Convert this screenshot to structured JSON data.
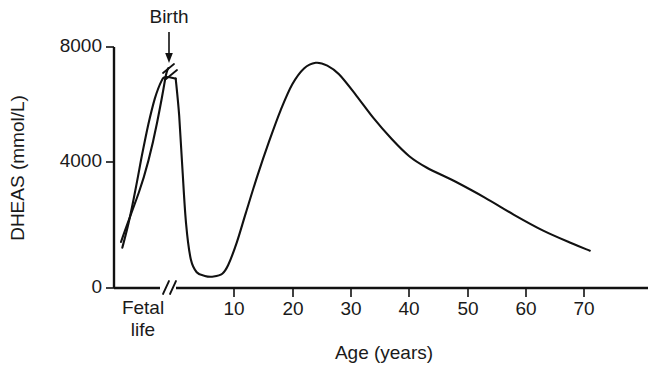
{
  "chart_data": {
    "type": "line",
    "title": "",
    "xlabel": "Age (years)",
    "ylabel": "DHEAS (mmol/L)",
    "xlim": [
      -12,
      74
    ],
    "ylim": [
      0,
      8400
    ],
    "grid": false,
    "legend": "none",
    "axis_break_x": "between fetal life and postnatal age scale",
    "curve_break_marker": "slash break on curve at birth peak",
    "x_ticks": [
      {
        "value": 10,
        "label": "10"
      },
      {
        "value": 20,
        "label": "20"
      },
      {
        "value": 30,
        "label": "30"
      },
      {
        "value": 40,
        "label": "40"
      },
      {
        "value": 50,
        "label": "50"
      },
      {
        "value": 60,
        "label": "60"
      },
      {
        "value": 70,
        "label": "70"
      }
    ],
    "y_ticks": [
      {
        "value": 0,
        "label": "0"
      },
      {
        "value": 4000,
        "label": "4000"
      },
      {
        "value": 8000,
        "label": "8000"
      }
    ],
    "category_labels": [
      {
        "line1": "Fetal",
        "line2": "life"
      }
    ],
    "annotations": [
      {
        "text": "Birth",
        "points_to": "peak of fetal DHEAS curve at birth"
      }
    ],
    "series": [
      {
        "name": "DHEAS concentration",
        "points": [
          {
            "x": -11.0,
            "y": 1400,
            "stage": "early fetal life"
          },
          {
            "x": -9.5,
            "y": 2300,
            "stage": "fetal life"
          },
          {
            "x": -8.0,
            "y": 3400,
            "stage": "fetal life"
          },
          {
            "x": -6.5,
            "y": 4600,
            "stage": "fetal life"
          },
          {
            "x": -5.0,
            "y": 5700,
            "stage": "fetal life"
          },
          {
            "x": -3.5,
            "y": 6600,
            "stage": "fetal life"
          },
          {
            "x": -2.0,
            "y": 7200,
            "stage": "late fetal life"
          },
          {
            "x": -1.0,
            "y": 7350,
            "stage": "birth peak"
          },
          {
            "x": 0.0,
            "y": 7300,
            "stage": "birth"
          },
          {
            "x": 0.6,
            "y": 6000,
            "stage": "neonatal decline"
          },
          {
            "x": 1.2,
            "y": 4000,
            "stage": "neonatal decline"
          },
          {
            "x": 1.8,
            "y": 2200,
            "stage": "infancy"
          },
          {
            "x": 2.6,
            "y": 1000,
            "stage": "infancy"
          },
          {
            "x": 3.6,
            "y": 550,
            "stage": "childhood nadir"
          },
          {
            "x": 5.0,
            "y": 420,
            "stage": "childhood nadir"
          },
          {
            "x": 6.5,
            "y": 400,
            "stage": "childhood nadir"
          },
          {
            "x": 8.0,
            "y": 500,
            "stage": "adrenarche onset"
          },
          {
            "x": 9.0,
            "y": 800,
            "stage": "adrenarche"
          },
          {
            "x": 10.5,
            "y": 1600,
            "stage": "adrenarche"
          },
          {
            "x": 12.0,
            "y": 2600,
            "stage": "puberty"
          },
          {
            "x": 14.0,
            "y": 3900,
            "stage": "puberty"
          },
          {
            "x": 16.0,
            "y": 5100,
            "stage": "adolescence"
          },
          {
            "x": 18.0,
            "y": 6200,
            "stage": "adolescence"
          },
          {
            "x": 20.0,
            "y": 7100,
            "stage": "young adult"
          },
          {
            "x": 22.0,
            "y": 7650,
            "stage": "young adult"
          },
          {
            "x": 24.0,
            "y": 7850,
            "stage": "adult peak"
          },
          {
            "x": 26.0,
            "y": 7750,
            "stage": "adult"
          },
          {
            "x": 28.0,
            "y": 7450,
            "stage": "adrenopause onset"
          },
          {
            "x": 31.0,
            "y": 6700,
            "stage": "adrenopause"
          },
          {
            "x": 34.0,
            "y": 5900,
            "stage": "adrenopause"
          },
          {
            "x": 37.0,
            "y": 5200,
            "stage": "adrenopause"
          },
          {
            "x": 40.0,
            "y": 4600,
            "stage": "adrenopause"
          },
          {
            "x": 43.0,
            "y": 4200,
            "stage": "adrenopause plateau"
          },
          {
            "x": 48.0,
            "y": 3700,
            "stage": "middle age"
          },
          {
            "x": 53.0,
            "y": 3150,
            "stage": "middle age"
          },
          {
            "x": 58.0,
            "y": 2550,
            "stage": "older adult"
          },
          {
            "x": 63.0,
            "y": 2000,
            "stage": "older adult"
          },
          {
            "x": 68.0,
            "y": 1550,
            "stage": "older adult"
          },
          {
            "x": 71.0,
            "y": 1300,
            "stage": "older adult"
          }
        ]
      }
    ]
  },
  "figure": {
    "colors": {
      "curve": "#111111",
      "axis": "#111111",
      "text": "#1a1a1a",
      "background": "#ffffff"
    }
  }
}
